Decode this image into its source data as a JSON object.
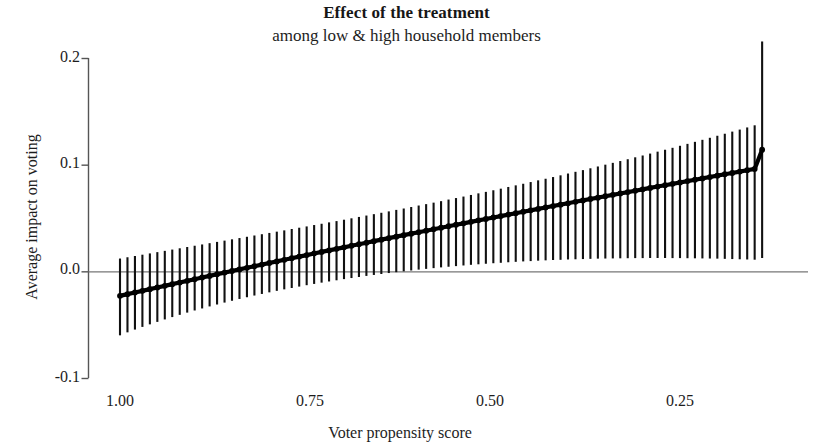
{
  "chart_data": {
    "type": "line",
    "title": "Effect of the treatment",
    "subtitle": "among low & high household members",
    "xlabel": "Voter propensity score",
    "ylabel": "Average impact on voting",
    "grid": false,
    "legend": null,
    "x_axis": {
      "ticks": [
        "1.00",
        "0.75",
        "0.50",
        "0.25"
      ],
      "tick_values": [
        1.0,
        0.75,
        0.5,
        0.25
      ],
      "reversed": true,
      "range": [
        1.02,
        0.13
      ]
    },
    "y_axis": {
      "ticks": [
        "0.2",
        "0.1",
        "0.0",
        "-0.1"
      ],
      "tick_values": [
        0.2,
        0.1,
        0.0,
        -0.1
      ],
      "range": [
        -0.1,
        0.2
      ]
    },
    "zero_line": 0.0,
    "series": [
      {
        "name": "Average impact on voting",
        "type": "point-estimate-with-error-bars",
        "x": [
          1.0,
          0.99,
          0.98,
          0.97,
          0.96,
          0.95,
          0.94,
          0.93,
          0.92,
          0.91,
          0.9,
          0.89,
          0.88,
          0.87,
          0.86,
          0.85,
          0.84,
          0.83,
          0.82,
          0.81,
          0.8,
          0.79,
          0.78,
          0.77,
          0.76,
          0.75,
          0.74,
          0.73,
          0.72,
          0.71,
          0.7,
          0.69,
          0.68,
          0.67,
          0.66,
          0.65,
          0.64,
          0.63,
          0.62,
          0.61,
          0.6,
          0.59,
          0.58,
          0.57,
          0.56,
          0.55,
          0.54,
          0.53,
          0.52,
          0.51,
          0.5,
          0.49,
          0.48,
          0.47,
          0.46,
          0.45,
          0.44,
          0.43,
          0.42,
          0.41,
          0.4,
          0.39,
          0.38,
          0.37,
          0.36,
          0.35,
          0.34,
          0.33,
          0.32,
          0.31,
          0.3,
          0.29,
          0.28,
          0.27,
          0.26,
          0.25,
          0.24,
          0.23,
          0.22,
          0.21,
          0.2,
          0.19,
          0.18,
          0.17,
          0.16,
          0.15,
          0.14
        ],
        "y": [
          -0.023,
          -0.0214,
          -0.0198,
          -0.0183,
          -0.0167,
          -0.0151,
          -0.0136,
          -0.012,
          -0.0105,
          -0.0089,
          -0.0074,
          -0.0058,
          -0.0043,
          -0.0027,
          -0.0012,
          0.0003,
          0.0018,
          0.0033,
          0.0048,
          0.0063,
          0.0078,
          0.0093,
          0.0108,
          0.0123,
          0.0138,
          0.0152,
          0.0167,
          0.0182,
          0.0196,
          0.0211,
          0.0225,
          0.024,
          0.0254,
          0.0268,
          0.0283,
          0.0297,
          0.0311,
          0.0325,
          0.0339,
          0.0353,
          0.0367,
          0.0381,
          0.0395,
          0.0409,
          0.0423,
          0.0437,
          0.045,
          0.0464,
          0.0478,
          0.0491,
          0.0505,
          0.0518,
          0.0532,
          0.0545,
          0.0559,
          0.0572,
          0.0585,
          0.0599,
          0.0612,
          0.0625,
          0.0638,
          0.0652,
          0.0665,
          0.0678,
          0.0691,
          0.0704,
          0.0717,
          0.073,
          0.0743,
          0.0756,
          0.0769,
          0.0782,
          0.0795,
          0.0807,
          0.082,
          0.0833,
          0.0846,
          0.0859,
          0.0871,
          0.0884,
          0.0897,
          0.091,
          0.0922,
          0.0935,
          0.0948,
          0.096,
          0.114
        ],
        "ci_low": [
          -0.06,
          -0.0572,
          -0.0546,
          -0.0521,
          -0.0497,
          -0.0474,
          -0.0451,
          -0.0429,
          -0.0408,
          -0.0387,
          -0.0367,
          -0.0348,
          -0.0329,
          -0.0311,
          -0.0293,
          -0.0276,
          -0.0259,
          -0.0243,
          -0.0227,
          -0.0212,
          -0.0197,
          -0.0183,
          -0.0169,
          -0.0156,
          -0.0143,
          -0.013,
          -0.0118,
          -0.0106,
          -0.0095,
          -0.0084,
          -0.0073,
          -0.0063,
          -0.0053,
          -0.0043,
          -0.0034,
          -0.0025,
          -0.0016,
          -0.0008,
          0.0,
          0.0008,
          0.0016,
          0.0023,
          0.003,
          0.0037,
          0.0043,
          0.0049,
          0.0055,
          0.0061,
          0.0066,
          0.0071,
          0.0076,
          0.008,
          0.0085,
          0.0089,
          0.0093,
          0.0096,
          0.01,
          0.0103,
          0.0106,
          0.0108,
          0.0111,
          0.0113,
          0.0115,
          0.0117,
          0.0119,
          0.012,
          0.0121,
          0.0122,
          0.0123,
          0.0124,
          0.0124,
          0.0125,
          0.0125,
          0.0125,
          0.0124,
          0.0124,
          0.0123,
          0.0122,
          0.0121,
          0.012,
          0.0119,
          0.0117,
          0.0115,
          0.0113,
          0.0111,
          0.0109,
          0.0125
        ],
        "ci_high": [
          0.012,
          0.0132,
          0.0144,
          0.0156,
          0.0168,
          0.018,
          0.0192,
          0.0204,
          0.0216,
          0.0228,
          0.024,
          0.0252,
          0.0264,
          0.0276,
          0.0288,
          0.03,
          0.0312,
          0.0324,
          0.0336,
          0.0348,
          0.036,
          0.0372,
          0.0384,
          0.0397,
          0.0409,
          0.0421,
          0.0434,
          0.0446,
          0.0459,
          0.0471,
          0.0484,
          0.0497,
          0.051,
          0.0523,
          0.0536,
          0.0549,
          0.0562,
          0.0576,
          0.0589,
          0.0603,
          0.0617,
          0.063,
          0.0644,
          0.0658,
          0.0673,
          0.0687,
          0.0701,
          0.0716,
          0.0731,
          0.0745,
          0.076,
          0.0775,
          0.0791,
          0.0806,
          0.0821,
          0.0837,
          0.0853,
          0.0868,
          0.0884,
          0.09,
          0.0917,
          0.0933,
          0.0949,
          0.0966,
          0.0983,
          0.1,
          0.1017,
          0.1034,
          0.1051,
          0.1069,
          0.1086,
          0.1104,
          0.1122,
          0.114,
          0.1158,
          0.1177,
          0.1195,
          0.1214,
          0.1233,
          0.1252,
          0.1271,
          0.129,
          0.131,
          0.1329,
          0.1349,
          0.1369,
          0.2155
        ]
      }
    ],
    "colors": {
      "line": "#000000",
      "error_bar": "#111111",
      "axis": "#555555",
      "zero_line": "#777777",
      "background": "#ffffff"
    }
  }
}
